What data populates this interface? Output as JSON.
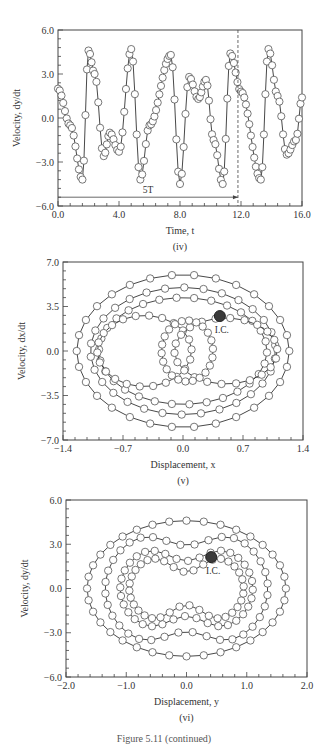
{
  "figure": {
    "caption": "Figure 5.11 (continued)"
  },
  "chart_data": [
    {
      "id": "iv",
      "type": "line",
      "marker": "open-circle",
      "panel_label": "(iv)",
      "title": "",
      "xlabel": "Time, t",
      "ylabel": "Velocity, dy/dt",
      "xlim": [
        0.0,
        16.0
      ],
      "ylim": [
        -6.0,
        6.0
      ],
      "xticks": [
        "0.0",
        "4.0",
        "8.0",
        "12.0",
        "16.0"
      ],
      "yticks": [
        "-6.0",
        "-3.0",
        "0.0",
        "3.0",
        "6.0"
      ],
      "grid": false,
      "annotations": [
        {
          "text": "5T",
          "type": "span-arrow",
          "x_start": 0.0,
          "x_end": 11.8,
          "y": -5.4
        },
        {
          "text": "",
          "type": "vertical-dashed-line",
          "x": 11.8
        }
      ],
      "x": [
        0.0,
        0.8,
        1.6,
        2.0,
        2.4,
        3.0,
        3.4,
        4.0,
        4.8,
        5.4,
        6.0,
        7.4,
        8.0,
        8.6,
        9.2,
        9.7,
        10.2,
        10.8,
        11.3,
        12.0,
        13.3,
        13.8,
        14.4,
        15.0,
        15.6,
        16.0
      ],
      "values": [
        2.0,
        -0.5,
        -4.2,
        4.6,
        3.0,
        -2.6,
        -1.0,
        -2.3,
        4.7,
        -4.2,
        -0.5,
        4.3,
        -4.5,
        2.8,
        1.3,
        2.6,
        -1.5,
        -4.5,
        4.4,
        1.8,
        -4.2,
        4.7,
        1.5,
        -2.5,
        -1.5,
        1.4
      ]
    },
    {
      "id": "v",
      "type": "scatter",
      "marker": "open-circle-connected",
      "panel_label": "(v)",
      "title": "",
      "xlabel": "Displacement, x",
      "ylabel": "Velocity, dx/dt",
      "xlim": [
        -1.4,
        1.4
      ],
      "ylim": [
        -7.0,
        7.0
      ],
      "xticks": [
        "-1.4",
        "-0.7",
        "0.0",
        "0.7",
        "1.4"
      ],
      "yticks": [
        "-7.0",
        "-3.5",
        "0.0",
        "3.5",
        "7.0"
      ],
      "grid": false,
      "annotations": [
        {
          "text": "I.C.",
          "type": "filled-marker",
          "x": 0.43,
          "y": 2.75
        }
      ],
      "orbits": [
        {
          "name": "outer-orbit",
          "x_amp": 1.24,
          "y_amp": 6.0
        },
        {
          "name": "middle-orbit",
          "x_amp": 1.08,
          "y_amp": 5.0
        },
        {
          "name": "inner-orbit",
          "x_amp": 0.98,
          "y_amp": 4.2
        },
        {
          "name": "left-lobe",
          "x_center": -0.45,
          "x_amp": 0.55,
          "y_amp": 2.8
        },
        {
          "name": "right-lobe",
          "x_center": 0.5,
          "x_amp": 0.6,
          "y_amp": 2.6
        },
        {
          "name": "central-cluster",
          "x_center": 0.05,
          "x_amp": 0.3,
          "y_amp": 2.4
        }
      ]
    },
    {
      "id": "vi",
      "type": "scatter",
      "marker": "open-circle-connected",
      "panel_label": "(vi)",
      "title": "",
      "xlabel": "Displacement, y",
      "ylabel": "Velocity, dy/dt",
      "xlim": [
        -2.0,
        2.0
      ],
      "ylim": [
        -6.0,
        6.0
      ],
      "xticks": [
        "-2.0",
        "-1.0",
        "0.0",
        "1.0",
        "2.0"
      ],
      "yticks": [
        "-6.0",
        "-3.0",
        "0.0",
        "3.0",
        "6.0"
      ],
      "grid": false,
      "annotations": [
        {
          "text": "I.C.",
          "type": "filled-marker",
          "x": 0.41,
          "y": 2.13
        }
      ],
      "orbits": [
        {
          "name": "outer-peanut",
          "x_amp": 1.65,
          "y_amp": 4.6,
          "waist": 0.0
        },
        {
          "name": "second-peanut",
          "x_amp": 1.35,
          "y_amp": 4.5,
          "waist": 0.35
        },
        {
          "name": "third-peanut",
          "x_amp": 1.1,
          "y_amp": 3.4,
          "waist": 0.45
        },
        {
          "name": "inner-peanut",
          "x_amp": 0.95,
          "y_amp": 2.8,
          "waist": 0.6
        }
      ]
    }
  ],
  "layout": {
    "panels": [
      {
        "left": 58,
        "right": 302,
        "top": 30,
        "bottom": 206
      },
      {
        "left": 63,
        "right": 303,
        "top": 262,
        "bottom": 440
      },
      {
        "left": 66,
        "right": 307,
        "top": 500,
        "bottom": 677
      }
    ],
    "colors": {
      "axis": "#444444",
      "line": "#333333",
      "marker_fill": "#ffffff",
      "marker_stroke": "#555555",
      "ic_fill": "#3a3a3a"
    }
  }
}
